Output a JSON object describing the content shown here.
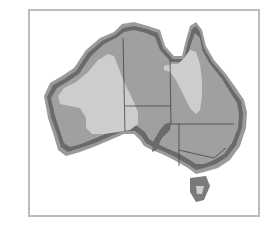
{
  "map": {
    "subject": "Australia",
    "style": "grayscale zoned map",
    "colors": {
      "frame": "#bdbdbd",
      "coast_band_outer": "#8a8a8a",
      "coast_band_dark": "#555555",
      "interior_medium": "#9c9c9c",
      "interior_light": "#cdcdcd",
      "state_border": "#444444"
    },
    "regions": [
      {
        "name": "coastal-band",
        "shade": "dark"
      },
      {
        "name": "interior-medium",
        "shade": "medium"
      },
      {
        "name": "western-light-zone",
        "shade": "light"
      },
      {
        "name": "queensland-light-zone",
        "shade": "light"
      }
    ],
    "borders": [
      "WA-border",
      "NT-SA-border",
      "QLD-border",
      "NSW-border",
      "VIC-border"
    ],
    "islands": [
      "tasmania"
    ]
  }
}
